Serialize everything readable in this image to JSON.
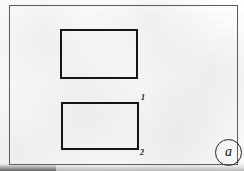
{
  "figure": {
    "subfigure_label": "a",
    "frame": {
      "name": "figure-border",
      "stroke_color": "#5b5b5b"
    },
    "background_color": "#fdfdfd",
    "ink_color": "#151515",
    "shapes": [
      {
        "name": "upper-rectangle",
        "type": "rectangle",
        "label": "",
        "stroke_color": "#151515"
      },
      {
        "name": "lower-rectangle",
        "type": "rectangle",
        "label": "",
        "stroke_color": "#151515"
      }
    ],
    "callouts": [
      {
        "name": "callout-1",
        "text": "1",
        "anchor": "lower-rectangle-top-right"
      },
      {
        "name": "callout-2",
        "text": "2",
        "anchor": "lower-rectangle-bottom-right"
      }
    ]
  }
}
